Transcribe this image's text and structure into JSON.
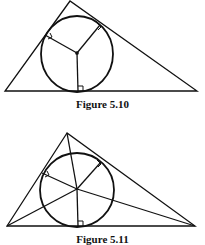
{
  "figures": [
    {
      "id": "fig1",
      "caption": "Figure 5.10",
      "description": "Triangle with inscribed circle; three radii drawn perpendicular to each side from the incenter",
      "triangle": [
        [
          70,
          1
        ],
        [
          5,
          91
        ],
        [
          197,
          91
        ]
      ],
      "incenter": [
        77,
        53
      ],
      "radius": 37,
      "feet": [
        [
          44,
          35
        ],
        [
          100,
          26
        ],
        [
          78,
          91
        ]
      ]
    },
    {
      "id": "fig2",
      "caption": "Figure 5.11",
      "description": "Triangle with inscribed circle; angle bisectors from each vertex meet at incenter, with perpendicular radii to sides",
      "triangle": [
        [
          67,
          133
        ],
        [
          7,
          226
        ],
        [
          195,
          226
        ]
      ],
      "incenter": [
        77,
        189
      ],
      "radius": 37,
      "feet": [
        [
          42,
          173
        ],
        [
          101,
          163
        ],
        [
          78,
          226
        ]
      ]
    }
  ],
  "colors": {
    "ink": "#111111",
    "background": "#ffffff"
  }
}
